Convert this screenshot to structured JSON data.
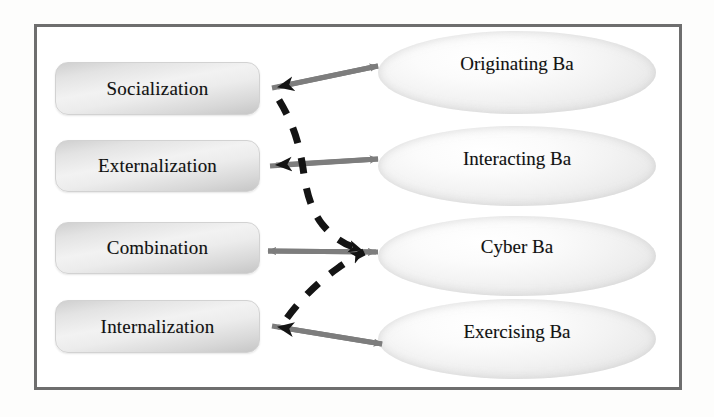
{
  "diagram": {
    "frame": {
      "border_color": "#6e6e6e",
      "background": "#ffffff"
    },
    "colors": {
      "arrow_gray": "#7d7d7d",
      "arrow_black": "#141414",
      "box_fill_light": "#f2f2f2",
      "box_fill_dark": "#c6c6c6",
      "ellipse_fill": "#f3f3f3",
      "text": "#111111"
    },
    "seci_modes": [
      {
        "id": "socialization",
        "label": "Socialization",
        "x": 55,
        "y": 62,
        "w": 205,
        "h": 53
      },
      {
        "id": "externalization",
        "label": "Externalization",
        "x": 55,
        "y": 140,
        "w": 205,
        "h": 52
      },
      {
        "id": "combination",
        "label": "Combination",
        "x": 55,
        "y": 222,
        "w": 205,
        "h": 52
      },
      {
        "id": "internalization",
        "label": "Internalization",
        "x": 55,
        "y": 300,
        "w": 205,
        "h": 53
      }
    ],
    "ba_spaces": [
      {
        "id": "originating-ba",
        "label": "Originating Ba",
        "x": 378,
        "y": 31,
        "w": 278,
        "h": 83,
        "label_y": 22
      },
      {
        "id": "interacting-ba",
        "label": "Interacting Ba",
        "x": 378,
        "y": 126,
        "w": 278,
        "h": 80,
        "label_y": 22
      },
      {
        "id": "cyber-ba",
        "label": "Cyber Ba",
        "x": 378,
        "y": 216,
        "w": 278,
        "h": 80,
        "label_y": 20
      },
      {
        "id": "exercising-ba",
        "label": "Exercising Ba",
        "x": 378,
        "y": 299,
        "w": 278,
        "h": 80,
        "label_y": 22
      }
    ],
    "connections": [
      {
        "id": "socialization-originating-ba",
        "from": "Socialization",
        "to": "Originating Ba",
        "style": "double-arrow",
        "direction": "bidirectional"
      },
      {
        "id": "externalization-interacting-ba",
        "from": "Externalization",
        "to": "Interacting Ba",
        "style": "double-arrow",
        "direction": "bidirectional"
      },
      {
        "id": "combination-cyber-ba",
        "from": "Combination",
        "to": "Cyber Ba",
        "style": "double-arrow",
        "direction": "bidirectional"
      },
      {
        "id": "internalization-exercising-ba",
        "from": "Internalization",
        "to": "Exercising Ba",
        "style": "double-arrow",
        "direction": "bidirectional"
      },
      {
        "id": "spiral-upper",
        "from": "Socialization",
        "to": "Cyber Ba",
        "style": "dashed-curve",
        "direction": "to-cyber-ba"
      },
      {
        "id": "spiral-lower",
        "from": "Internalization",
        "to": "Cyber Ba",
        "style": "dashed-curve",
        "direction": "to-cyber-ba"
      }
    ]
  }
}
